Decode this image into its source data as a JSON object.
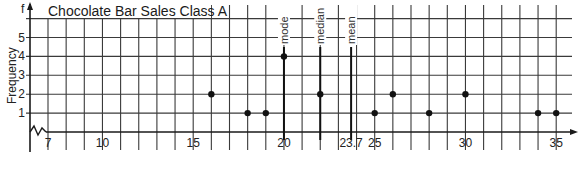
{
  "chart_data": {
    "type": "scatter",
    "subtype": "dot-frequency-plot",
    "title": "Chocolate Bar Sales Class A",
    "xlabel": "",
    "ylabel": "Frequency",
    "y_axis_letter": "f",
    "x_ticks": [
      7,
      10,
      15,
      20,
      23.7,
      25,
      30,
      35
    ],
    "x_tick_labels": [
      "7",
      "10",
      "15",
      "20",
      "23.7",
      "25",
      "30",
      "35"
    ],
    "y_ticks": [
      1,
      2,
      3,
      4,
      5
    ],
    "y_tick_labels": [
      "1",
      "2",
      "3",
      "4",
      "5"
    ],
    "xlim": [
      6,
      36
    ],
    "ylim": [
      0,
      6
    ],
    "axis_break": true,
    "grid": true,
    "points": [
      {
        "x": 16,
        "f": 2
      },
      {
        "x": 18,
        "f": 1
      },
      {
        "x": 19,
        "f": 1
      },
      {
        "x": 20,
        "f": 4
      },
      {
        "x": 22,
        "f": 2
      },
      {
        "x": 25,
        "f": 1
      },
      {
        "x": 26,
        "f": 2
      },
      {
        "x": 28,
        "f": 1
      },
      {
        "x": 30,
        "f": 2
      },
      {
        "x": 34,
        "f": 1
      },
      {
        "x": 35,
        "f": 1
      }
    ],
    "annotations": [
      {
        "label": "mode",
        "x": 20
      },
      {
        "label": "median",
        "x": 22
      },
      {
        "label": "mean",
        "x": 23.7
      }
    ]
  },
  "colors": {
    "grid": "#3a3a3a",
    "axis": "#1a1a1a",
    "point": "#111111",
    "background": "#ffffff"
  }
}
